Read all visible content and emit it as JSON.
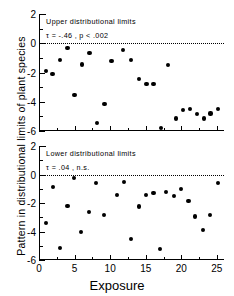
{
  "figure": {
    "ylabel": "Pattern in distributional limits of plant species",
    "xlabel": "Exposure"
  },
  "chart_data": [
    {
      "type": "scatter",
      "panel": "upper",
      "title": "Upper distributional limits",
      "annotation": "τ = -.46 , p < .002",
      "tau": -0.46,
      "p_text": "p < .002",
      "xlabel": "",
      "ylabel": "",
      "xlim": [
        0,
        26
      ],
      "ylim": [
        -6,
        2
      ],
      "xticks": [
        0,
        5,
        10,
        15,
        20,
        25
      ],
      "yticks": [
        2,
        0,
        -2,
        -4,
        -6
      ],
      "grid": false,
      "reference_line": {
        "y": 0,
        "style": "dotted"
      },
      "points": [
        {
          "x": 1.0,
          "y": -1.9
        },
        {
          "x": 1.9,
          "y": -2.1
        },
        {
          "x": 3.0,
          "y": -1.15
        },
        {
          "x": 4.0,
          "y": -0.3
        },
        {
          "x": 5.0,
          "y": -3.55
        },
        {
          "x": 6.1,
          "y": -1.45
        },
        {
          "x": 7.1,
          "y": -0.65
        },
        {
          "x": 8.1,
          "y": -5.45
        },
        {
          "x": 9.2,
          "y": -4.15
        },
        {
          "x": 10.2,
          "y": -1.2
        },
        {
          "x": 11.8,
          "y": -0.45
        },
        {
          "x": 12.9,
          "y": -1.15
        },
        {
          "x": 14.0,
          "y": -2.45
        },
        {
          "x": 15.1,
          "y": -2.8
        },
        {
          "x": 16.1,
          "y": -2.8
        },
        {
          "x": 17.1,
          "y": -5.8
        },
        {
          "x": 18.1,
          "y": -1.5
        },
        {
          "x": 19.2,
          "y": -5.15
        },
        {
          "x": 20.2,
          "y": -4.55
        },
        {
          "x": 21.2,
          "y": -4.5
        },
        {
          "x": 22.2,
          "y": -4.85
        },
        {
          "x": 23.2,
          "y": -5.15
        },
        {
          "x": 24.1,
          "y": -4.8
        },
        {
          "x": 25.1,
          "y": -4.5
        }
      ]
    },
    {
      "type": "scatter",
      "panel": "lower",
      "title": "Lower distributional limits",
      "annotation": "τ = .04 , n.s.",
      "tau": 0.04,
      "p_text": "n.s.",
      "xlabel": "Exposure",
      "ylabel": "",
      "xlim": [
        0,
        26
      ],
      "ylim": [
        -6,
        2
      ],
      "xticks": [
        0,
        5,
        10,
        15,
        20,
        25
      ],
      "yticks": [
        2,
        0,
        -2,
        -4,
        -6
      ],
      "grid": false,
      "reference_line": {
        "y": 0,
        "style": "dotted"
      },
      "points": [
        {
          "x": 1.0,
          "y": -3.4
        },
        {
          "x": 2.0,
          "y": -0.85
        },
        {
          "x": 3.0,
          "y": -5.15
        },
        {
          "x": 4.0,
          "y": -2.2
        },
        {
          "x": 4.9,
          "y": -0.25
        },
        {
          "x": 5.9,
          "y": -4.05
        },
        {
          "x": 7.0,
          "y": -2.65
        },
        {
          "x": 8.0,
          "y": -0.6
        },
        {
          "x": 9.1,
          "y": -2.85
        },
        {
          "x": 11.0,
          "y": -1.45
        },
        {
          "x": 12.0,
          "y": -0.5
        },
        {
          "x": 12.9,
          "y": -4.55
        },
        {
          "x": 14.0,
          "y": -2.25
        },
        {
          "x": 15.0,
          "y": -1.45
        },
        {
          "x": 16.1,
          "y": -1.3
        },
        {
          "x": 17.0,
          "y": -5.2
        },
        {
          "x": 17.9,
          "y": -1.25
        },
        {
          "x": 19.0,
          "y": -1.5
        },
        {
          "x": 20.0,
          "y": -1.0
        },
        {
          "x": 21.0,
          "y": -1.85
        },
        {
          "x": 21.9,
          "y": -2.95
        },
        {
          "x": 23.0,
          "y": -3.9
        },
        {
          "x": 24.0,
          "y": -2.85
        },
        {
          "x": 25.1,
          "y": -0.6
        }
      ]
    }
  ]
}
